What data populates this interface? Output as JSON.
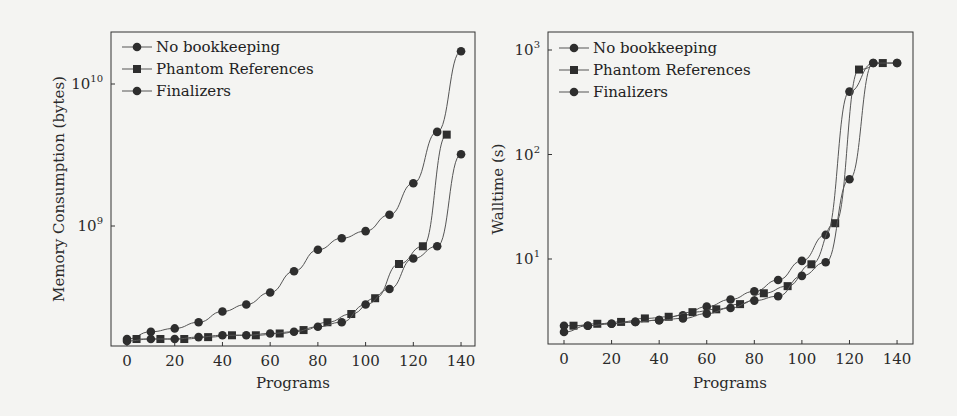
{
  "chart_data": [
    {
      "type": "line",
      "title": "",
      "xlabel": "Programs",
      "ylabel": "Memory Consumption (bytes)",
      "yscale": "log",
      "xlim": [
        0,
        140
      ],
      "ylim": [
        130000000.0,
        22000000000.0
      ],
      "x_ticks": [
        "0",
        "20",
        "40",
        "60",
        "80",
        "100",
        "120",
        "140"
      ],
      "y_ticks": [
        {
          "base": "10",
          "exp": "9",
          "value": 1000000000.0
        },
        {
          "base": "10",
          "exp": "10",
          "value": 10000000000.0
        }
      ],
      "grid": false,
      "legend_position": "upper left",
      "series": [
        {
          "name": "No bookkeeping",
          "marker": "circle",
          "x": [
            0,
            10,
            20,
            30,
            40,
            50,
            60,
            70,
            80,
            90,
            100,
            110,
            120,
            130,
            140
          ],
          "values": [
            160000000.0,
            180000000.0,
            190000000.0,
            210000000.0,
            250000000.0,
            280000000.0,
            340000000.0,
            480000000.0,
            680000000.0,
            820000000.0,
            920000000.0,
            1200000000.0,
            2000000000.0,
            4600000000.0,
            17000000000.0
          ]
        },
        {
          "name": "Phantom References",
          "marker": "square",
          "x": [
            4,
            14,
            24,
            34,
            44,
            54,
            64,
            74,
            84,
            94,
            104,
            114,
            124,
            134
          ],
          "values": [
            160000000.0,
            160000000.0,
            160000000.0,
            165000000.0,
            170000000.0,
            170000000.0,
            175000000.0,
            185000000.0,
            210000000.0,
            240000000.0,
            310000000.0,
            540000000.0,
            720000000.0,
            4400000000.0
          ]
        },
        {
          "name": "Finalizers",
          "marker": "circle",
          "x": [
            0,
            10,
            20,
            30,
            40,
            50,
            60,
            70,
            80,
            90,
            100,
            110,
            120,
            130,
            140
          ],
          "values": [
            155000000.0,
            160000000.0,
            160000000.0,
            165000000.0,
            170000000.0,
            170000000.0,
            175000000.0,
            180000000.0,
            195000000.0,
            210000000.0,
            280000000.0,
            360000000.0,
            590000000.0,
            720000000.0,
            3200000000.0
          ]
        }
      ]
    },
    {
      "type": "line",
      "title": "",
      "xlabel": "Programs",
      "ylabel": "Walltime (s)",
      "yscale": "log",
      "xlim": [
        0,
        140
      ],
      "ylim": [
        1.6,
        1200
      ],
      "x_ticks": [
        "0",
        "20",
        "40",
        "60",
        "80",
        "100",
        "120",
        "140"
      ],
      "y_ticks": [
        {
          "base": "10",
          "exp": "1",
          "value": 10
        },
        {
          "base": "10",
          "exp": "2",
          "value": 100
        },
        {
          "base": "10",
          "exp": "3",
          "value": 1000
        }
      ],
      "grid": false,
      "legend_position": "upper left",
      "series": [
        {
          "name": "No bookkeeping",
          "marker": "circle",
          "x": [
            0,
            10,
            20,
            30,
            40,
            50,
            60,
            70,
            80,
            90,
            100,
            110,
            120,
            130,
            140
          ],
          "values": [
            2.3,
            2.3,
            2.4,
            2.5,
            2.6,
            2.9,
            3.5,
            4.1,
            4.9,
            6.3,
            9.6,
            17,
            400,
            750,
            750
          ]
        },
        {
          "name": "Phantom References",
          "marker": "square",
          "x": [
            4,
            14,
            24,
            34,
            44,
            54,
            64,
            74,
            84,
            94,
            104,
            114,
            124,
            134
          ],
          "values": [
            2.3,
            2.4,
            2.5,
            2.7,
            2.8,
            3.1,
            3.3,
            3.7,
            4.7,
            5.5,
            8.9,
            22,
            650,
            750
          ]
        },
        {
          "name": "Finalizers",
          "marker": "circle",
          "x": [
            0,
            10,
            20,
            30,
            40,
            50,
            60,
            70,
            80,
            90,
            100,
            110,
            120,
            130,
            140
          ],
          "values": [
            2.0,
            2.3,
            2.4,
            2.5,
            2.6,
            2.7,
            3.0,
            3.4,
            4.0,
            4.4,
            6.9,
            9.3,
            58,
            750,
            750
          ]
        }
      ]
    }
  ],
  "charts": [
    {
      "xlabel": "Programs",
      "ylabel": "Memory Consumption (bytes)"
    },
    {
      "xlabel": "Programs",
      "ylabel": "Walltime (s)"
    }
  ],
  "legend": [
    "No bookkeeping",
    "Phantom References",
    "Finalizers"
  ],
  "colors": {
    "line": "#555555",
    "marker": "#2e2e2e",
    "frame": "#333333",
    "background": "#f4f4f2"
  }
}
